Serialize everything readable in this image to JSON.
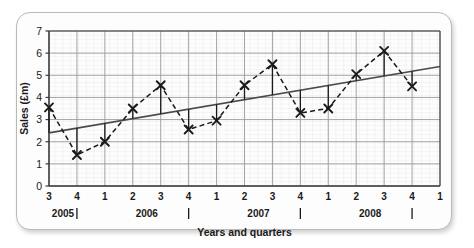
{
  "chart_data": {
    "type": "line",
    "title": "",
    "xlabel": "Years and quarters",
    "ylabel": "Sales (£m)",
    "ylim": [
      0,
      7
    ],
    "yticks": [
      0,
      1,
      2,
      3,
      4,
      5,
      6,
      7
    ],
    "grid": true,
    "minor_grid": true,
    "legend": "none",
    "x_tick_labels": [
      "3",
      "4",
      "1",
      "2",
      "3",
      "4",
      "1",
      "2",
      "3",
      "4",
      "1",
      "2",
      "3",
      "4",
      "1"
    ],
    "year_groups": [
      {
        "label": "2005",
        "quarters": [
          "3",
          "4"
        ]
      },
      {
        "label": "2006",
        "quarters": [
          "1",
          "2",
          "3",
          "4"
        ]
      },
      {
        "label": "2007",
        "quarters": [
          "1",
          "2",
          "3",
          "4"
        ]
      },
      {
        "label": "2008",
        "quarters": [
          "1",
          "2",
          "3",
          "4"
        ]
      }
    ],
    "year_boundary_ticks": [
      1,
      5,
      9,
      13
    ],
    "categories": [
      "2005 Q3",
      "2005 Q4",
      "2006 Q1",
      "2006 Q2",
      "2006 Q3",
      "2006 Q4",
      "2007 Q1",
      "2007 Q2",
      "2007 Q3",
      "2007 Q4",
      "2008 Q1",
      "2008 Q2",
      "2008 Q3",
      "2008 Q4"
    ],
    "series": [
      {
        "name": "Sales",
        "style": "dashed-line-with-cross-markers",
        "marker": "x",
        "color": "#1a1a1a",
        "values": [
          3.55,
          1.4,
          2.0,
          3.5,
          4.55,
          2.55,
          2.95,
          4.55,
          5.5,
          3.3,
          3.5,
          5.05,
          6.1,
          4.5
        ]
      },
      {
        "name": "Trend line",
        "style": "solid-straight-line",
        "color": "#4a4a4a",
        "start_value": 2.4,
        "end_value": 5.4,
        "values": [
          2.46,
          2.67,
          2.88,
          3.09,
          3.3,
          3.51,
          3.72,
          3.93,
          4.14,
          4.35,
          4.56,
          4.77,
          4.98,
          5.19
        ]
      }
    ],
    "residual_drop_lines": true,
    "colors": {
      "data_line": "#1a1a1a",
      "trend_line": "#4a4a4a",
      "major_grid": "#9a9a9a",
      "minor_grid": "#d6d6d6",
      "axis": "#3a3a3a",
      "card_border": "#b9b9b9",
      "background": "#fdfdfd"
    }
  }
}
